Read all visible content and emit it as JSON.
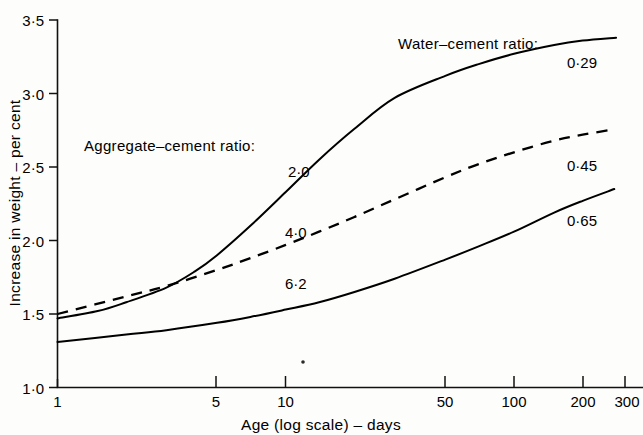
{
  "chart_data": {
    "type": "line",
    "title": "",
    "xlabel": "Age (log scale) – days",
    "ylabel": "Increase in weight – per cent",
    "xscale": "log",
    "xlim": [
      1,
      300
    ],
    "ylim": [
      1.0,
      3.5
    ],
    "grid": false,
    "legend_position": "inline-annotations",
    "xticks": [
      1,
      5,
      10,
      50,
      100,
      200,
      300
    ],
    "xticklabels": [
      "1",
      "5",
      "10",
      "50",
      "100",
      "200",
      "300"
    ],
    "yticks": [
      1.0,
      1.5,
      2.0,
      2.5,
      3.0,
      3.5
    ],
    "yticklabels": [
      "1·0",
      "1·5",
      "2·0",
      "2·5",
      "3·0",
      "3·5"
    ],
    "annotations": [
      {
        "text": "Water–cement ratio:",
        "x_px": 398,
        "y_px": 49
      },
      {
        "text": "Aggregate–cement ratio:",
        "x_px": 84,
        "y_px": 151
      }
    ],
    "series": [
      {
        "name": "curve-1",
        "water_cement_ratio": "0·29",
        "aggregate_cement_ratio": "2·0",
        "style": "solid",
        "x": [
          1,
          1.5,
          2,
          3,
          4,
          5,
          7,
          10,
          14,
          20,
          30,
          50,
          70,
          100,
          150,
          200,
          280
        ],
        "y": [
          1.47,
          1.52,
          1.58,
          1.68,
          1.79,
          1.9,
          2.1,
          2.33,
          2.55,
          2.76,
          2.97,
          3.12,
          3.2,
          3.27,
          3.33,
          3.36,
          3.38
        ]
      },
      {
        "name": "curve-2",
        "water_cement_ratio": "0·45",
        "aggregate_cement_ratio": "4·0",
        "style": "dashed",
        "x": [
          1,
          2,
          3,
          5,
          7,
          10,
          14,
          20,
          30,
          50,
          70,
          100,
          150,
          200,
          260
        ],
        "y": [
          1.5,
          1.62,
          1.69,
          1.8,
          1.88,
          1.97,
          2.06,
          2.16,
          2.28,
          2.43,
          2.52,
          2.6,
          2.68,
          2.72,
          2.75
        ]
      },
      {
        "name": "curve-3",
        "water_cement_ratio": "0·65",
        "aggregate_cement_ratio": "6·2",
        "style": "solid",
        "x": [
          1,
          2,
          3,
          5,
          7,
          10,
          14,
          20,
          30,
          50,
          70,
          100,
          150,
          200,
          275
        ],
        "y": [
          1.31,
          1.36,
          1.39,
          1.44,
          1.48,
          1.53,
          1.58,
          1.65,
          1.74,
          1.87,
          1.96,
          2.06,
          2.19,
          2.27,
          2.35
        ]
      }
    ],
    "series_left_labels": [
      {
        "text": "2·0",
        "x_px": 288,
        "y_px": 177
      },
      {
        "text": "4·0",
        "x_px": 285,
        "y_px": 238
      },
      {
        "text": "6·2",
        "x_px": 285,
        "y_px": 289
      }
    ],
    "series_right_labels": [
      {
        "text": "0·29",
        "x_px": 567,
        "y_px": 68
      },
      {
        "text": "0·45",
        "x_px": 567,
        "y_px": 171
      },
      {
        "text": "0·65",
        "x_px": 567,
        "y_px": 226
      }
    ]
  },
  "axes": {
    "x_title": "Age (log scale) – days",
    "y_title": "Increase in weight – per cent"
  },
  "colors": {
    "ink": "#000000",
    "paper": "#fdfdfb"
  }
}
